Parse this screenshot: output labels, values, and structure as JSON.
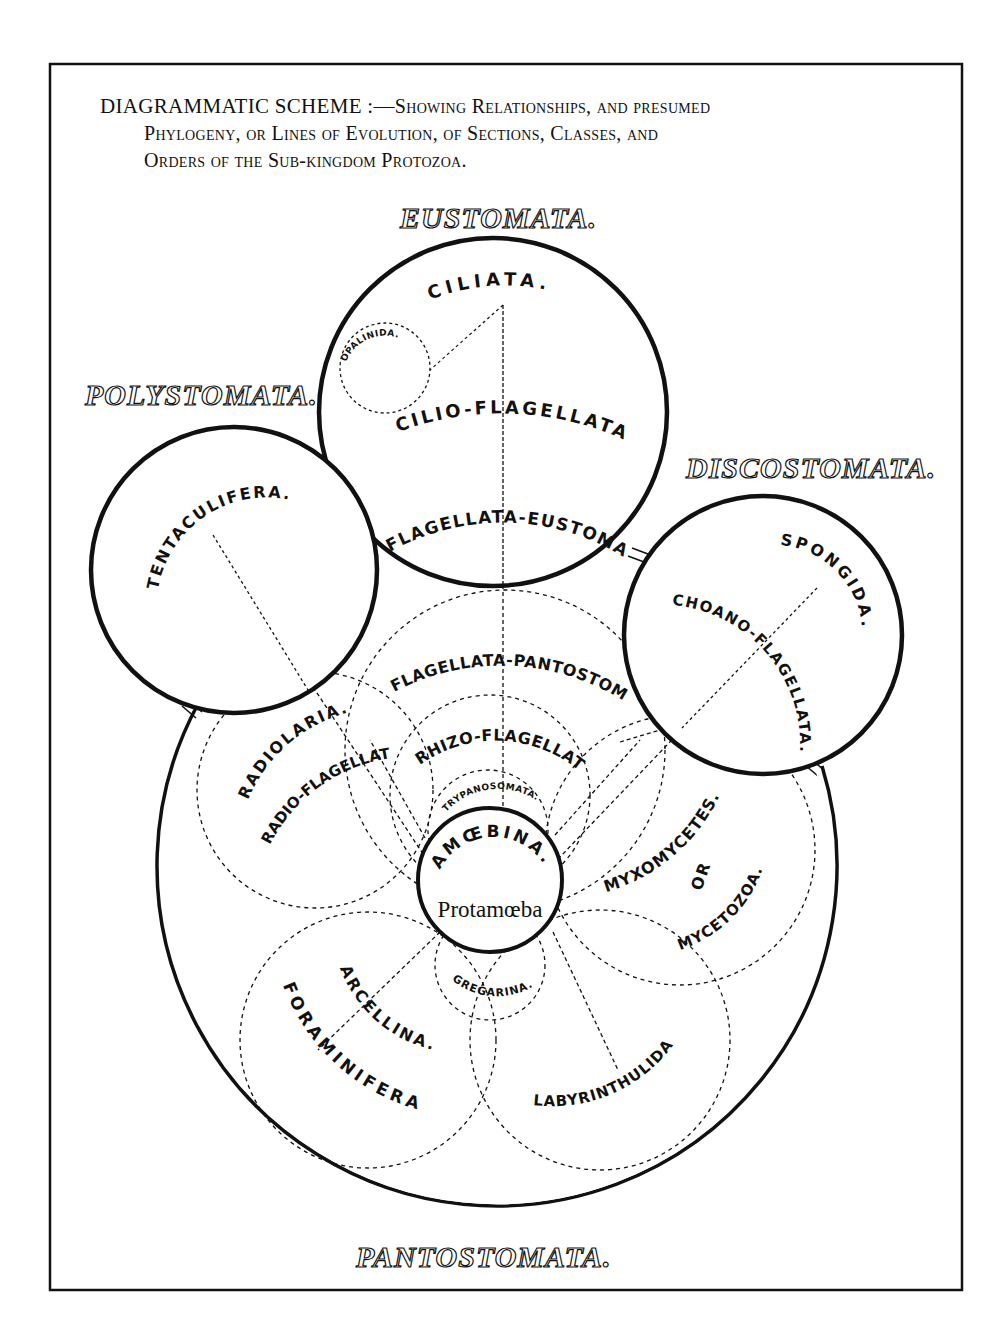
{
  "caption": {
    "line1_lead": "DIAGRAMMATIC SCHEME :—",
    "line1_rest": "Showing Relationships, and presumed",
    "line2": "Phylogeny, or Lines of Evolution, of Sections, Classes, and",
    "line3": "Orders of the Sub-kingdom Protozoa."
  },
  "groups": {
    "eustomata": "EUSTOMATA.",
    "polystomata": "POLYSTOMATA.",
    "discostomata": "DISCOSTOMATA.",
    "pantostomata": "PANTOSTOMATA."
  },
  "eustomata_labels": {
    "ciliata": "CILIATA.",
    "opalinida": "OPALINIDA.",
    "cilio_flagellata": "CILIO-FLAGELLATA.",
    "flagellata_eustomata": "FLAGELLATA-EUSTOMATA."
  },
  "polystomata_labels": {
    "tentaculifera": "TENTACULIFERA."
  },
  "discostomata_labels": {
    "spongida": "SPONGIDA.",
    "choano_flagellata": "CHOANO-FLAGELLATA."
  },
  "pantostomata_labels": {
    "flagellata_pantostomata": "FLAGELLATA-PANTOSTOMATA.",
    "rhizo_flagellata": "RHIZO-FLAGELLATA.",
    "trypanosomata": "TRYPANOSOMATA.",
    "radiolaria": "RADIOLARIA.",
    "radio_flagellata": "RADIO-FLAGELLATA.",
    "amoebina": "AMŒBINA.",
    "protamoeba": "Protamœba",
    "myxomycetes": "MYXOMYCETES.",
    "or": "OR",
    "mycetozoa": "MYCETOZOA.",
    "gregarina": "GREGARINA.",
    "arcellina": "ARCELLINA.",
    "foraminifera": "FORAMINIFERA.",
    "labyrinthulida": "LABYRINTHULIDA"
  },
  "colors": {
    "ink": "#111111",
    "paper": "#ffffff"
  }
}
